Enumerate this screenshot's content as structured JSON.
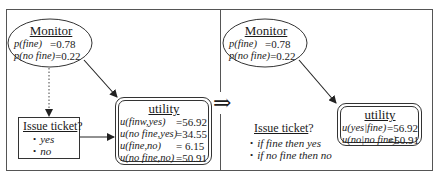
{
  "left_panel": {
    "monitor": {
      "title": "Monitor",
      "rows": [
        {
          "label": "p(fine)",
          "value": "=0.78"
        },
        {
          "label": "p(no fine)",
          "value": "=0.22"
        }
      ]
    },
    "decision": {
      "title": "Issue ticket",
      "suffix": "?",
      "options": [
        "yes",
        "no"
      ]
    },
    "utility": {
      "title": "utility",
      "rows": [
        {
          "label": "u(finw,yes)",
          "value": "=56.92"
        },
        {
          "label": "u(no fine,yes)",
          "value": "=34.55"
        },
        {
          "label": "u(fine,no)",
          "value": "= 6.15"
        },
        {
          "label": "u(no fine,no)",
          "value": "=50.91"
        }
      ]
    }
  },
  "transition": {
    "symbol": "⇒"
  },
  "right_panel": {
    "monitor": {
      "title": "Monitor",
      "rows": [
        {
          "label": "p(fine)",
          "value": "=0.78"
        },
        {
          "label": "p(no fine)",
          "value": "=0.22"
        }
      ]
    },
    "decision": {
      "title": "Issue ticket",
      "suffix": "?",
      "options": [
        "if fine then yes",
        "if no fine then no"
      ]
    },
    "utility": {
      "title": "utility",
      "rows": [
        {
          "label": "u(yes|fine)",
          "value": "=56.92"
        },
        {
          "label": "u(no|no fine)",
          "value": "=50.91"
        }
      ]
    }
  }
}
